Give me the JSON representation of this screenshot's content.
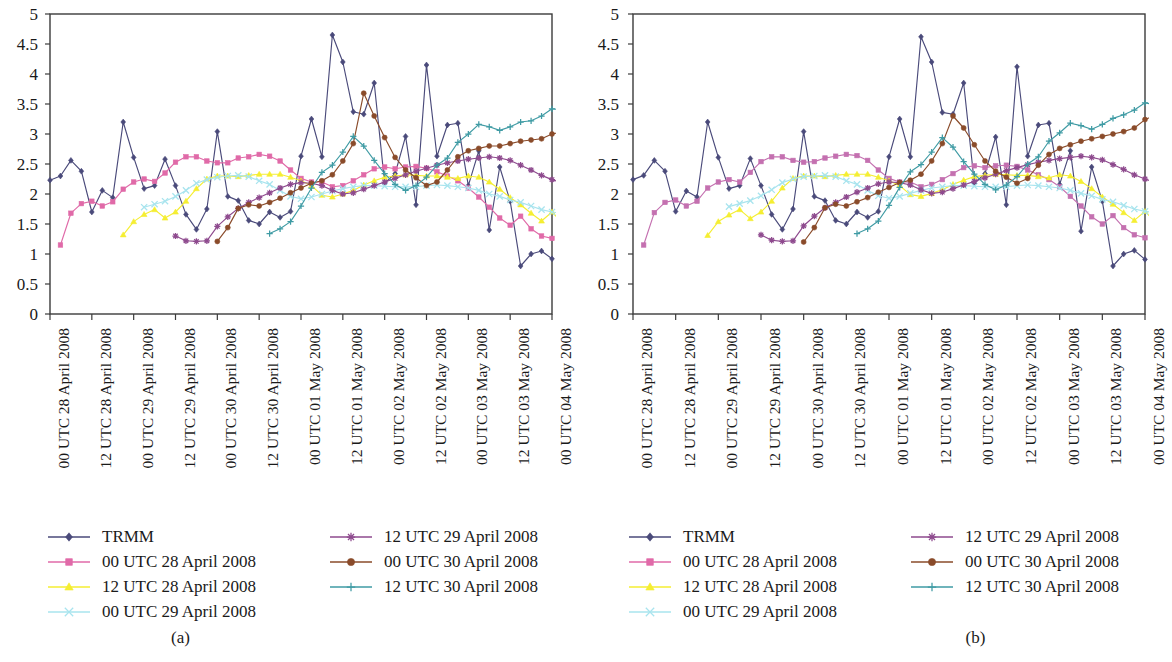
{
  "figure": {
    "panels": [
      {
        "id": "a",
        "caption": "(a)"
      },
      {
        "id": "b",
        "caption": "(b)"
      }
    ]
  },
  "axis": {
    "y_ticks": [
      "0",
      "0.5",
      "1",
      "1.5",
      "2",
      "2.5",
      "3",
      "3.5",
      "4",
      "4.5",
      "5"
    ],
    "x_ticks": [
      "00 UTC 28 April 2008",
      "12 UTC 28 April 2008",
      "00 UTC 29 April 2008",
      "12 UTC 29 April 2008",
      "00 UTC 30 April 2008",
      "12 UTC 30 April 2008",
      "00 UTC 01 May 2008",
      "12 UTC 01 May 2008",
      "00 UTC 02 May 2008",
      "12 UTC 02 May 2008",
      "00 UTC 03 May 2008",
      "12 UTC 03 May 2008",
      "00 UTC 04 May 2008"
    ]
  },
  "legend": {
    "entries": [
      {
        "label": "TRMM",
        "color": "#4a4a7a",
        "marker": "diamond",
        "col": "left"
      },
      {
        "label": "00 UTC 28 April 2008",
        "color": "#e06aa8",
        "marker": "square",
        "col": "left"
      },
      {
        "label": "12 UTC 28 April 2008",
        "color": "#f5ee32",
        "marker": "triangle",
        "col": "left"
      },
      {
        "label": "00 UTC 29 April 2008",
        "color": "#a8e4ee",
        "marker": "xmark",
        "col": "left"
      },
      {
        "label": "12 UTC 29 April 2008",
        "color": "#8e4a8e",
        "marker": "star",
        "col": "right"
      },
      {
        "label": "00 UTC 30 April 2008",
        "color": "#8a4b2a",
        "marker": "circle",
        "col": "right"
      },
      {
        "label": "12 UTC 30 April 2008",
        "color": "#3f9ba4",
        "marker": "plus",
        "col": "right"
      }
    ]
  },
  "chart_data": [
    {
      "panel": "(a)",
      "type": "line",
      "title": "",
      "xlabel": "",
      "ylabel": "",
      "ylim": [
        0,
        5
      ],
      "ytick_step": 0.5,
      "grid": false,
      "legend_position": "bottom",
      "x_tick_labels": [
        "00 UTC 28 April 2008",
        "12 UTC 28 April 2008",
        "00 UTC 29 April 2008",
        "12 UTC 29 April 2008",
        "00 UTC 30 April 2008",
        "12 UTC 30 April 2008",
        "00 UTC 01 May 2008",
        "12 UTC 01 May 2008",
        "00 UTC 02 May 2008",
        "12 UTC 02 May 2008",
        "00 UTC 03 May 2008",
        "12 UTC 03 May 2008",
        "00 UTC 04 May 2008"
      ],
      "x_index_of_tick": [
        0,
        4,
        8,
        12,
        16,
        20,
        24,
        28,
        32,
        36,
        40,
        44,
        48
      ],
      "series": [
        {
          "name": "TRMM",
          "color": "#4a4a7a",
          "marker": "diamond",
          "x_start": 0,
          "values": [
            2.23,
            2.3,
            2.56,
            2.38,
            1.7,
            2.06,
            1.94,
            3.2,
            2.61,
            2.09,
            2.14,
            2.58,
            2.14,
            1.66,
            1.41,
            1.75,
            3.04,
            1.96,
            1.89,
            1.56,
            1.5,
            1.7,
            1.61,
            1.71,
            2.63,
            3.25,
            2.62,
            4.65,
            4.2,
            3.37,
            3.33,
            3.85,
            2.18,
            2.34,
            2.96,
            1.82,
            4.15,
            2.63,
            3.15,
            3.18,
            2.14,
            2.72,
            1.4,
            2.45,
            1.88,
            0.8,
            1.0,
            1.05,
            0.92
          ]
        },
        {
          "name": "00 UTC 28 April 2008",
          "color": "#e06aa8",
          "marker": "square",
          "x_start": 1,
          "values": [
            1.15,
            1.68,
            1.84,
            1.88,
            1.8,
            1.87,
            2.08,
            2.2,
            2.25,
            2.21,
            2.35,
            2.53,
            2.62,
            2.62,
            2.55,
            2.52,
            2.52,
            2.6,
            2.62,
            2.66,
            2.63,
            2.55,
            2.4,
            2.26,
            2.2,
            2.2,
            2.12,
            2.14,
            2.22,
            2.32,
            2.42,
            2.45,
            2.42,
            2.45,
            2.46,
            2.43,
            2.37,
            2.3,
            2.22,
            2.1,
            1.95,
            1.78,
            1.6,
            1.48,
            1.63,
            1.42,
            1.3,
            1.26
          ]
        },
        {
          "name": "12 UTC 28 April 2008",
          "color": "#f5ee32",
          "marker": "triangle",
          "x_start": 7,
          "values": [
            1.32,
            1.54,
            1.66,
            1.74,
            1.6,
            1.7,
            1.88,
            2.09,
            2.25,
            2.3,
            2.3,
            2.29,
            2.31,
            2.33,
            2.33,
            2.33,
            2.28,
            2.22,
            2.14,
            1.98,
            1.95,
            2.0,
            2.06,
            2.15,
            2.22,
            2.28,
            2.3,
            2.32,
            2.31,
            2.3,
            2.3,
            2.28,
            2.26,
            2.3,
            2.28,
            2.2,
            2.08,
            1.94,
            1.82,
            1.68,
            1.55,
            1.7,
            1.52,
            1.4,
            1.35
          ]
        },
        {
          "name": "00 UTC 29 April 2008",
          "color": "#a8e4ee",
          "marker": "xmark",
          "x_start": 9,
          "values": [
            1.78,
            1.83,
            1.88,
            1.96,
            2.06,
            2.18,
            2.24,
            2.28,
            2.3,
            2.31,
            2.29,
            2.22,
            2.16,
            2.06,
            1.96,
            1.92,
            1.95,
            2.0,
            2.05,
            2.09,
            2.12,
            2.14,
            2.14,
            2.13,
            2.12,
            2.12,
            2.12,
            2.14,
            2.15,
            2.14,
            2.12,
            2.1,
            2.06,
            2.0,
            1.96,
            1.9,
            1.86,
            1.8,
            1.74,
            1.7,
            1.68,
            1.7
          ]
        },
        {
          "name": "12 UTC 29 April 2008",
          "color": "#8e4a8e",
          "marker": "star",
          "x_start": 12,
          "values": [
            1.3,
            1.22,
            1.21,
            1.22,
            1.46,
            1.62,
            1.76,
            1.86,
            1.94,
            2.02,
            2.1,
            2.16,
            2.19,
            2.18,
            2.14,
            2.06,
            2.0,
            2.02,
            2.08,
            2.14,
            2.2,
            2.26,
            2.32,
            2.38,
            2.43,
            2.48,
            2.52,
            2.55,
            2.58,
            2.6,
            2.62,
            2.6,
            2.56,
            2.48,
            2.4,
            2.31,
            2.24,
            2.18,
            2.12,
            2.1,
            2.16,
            2.14,
            2.1,
            2.0
          ]
        },
        {
          "name": "00 UTC 30 April 2008",
          "color": "#8a4b2a",
          "marker": "circle",
          "x_start": 16,
          "values": [
            1.21,
            1.44,
            1.76,
            1.82,
            1.8,
            1.86,
            1.93,
            2.02,
            2.1,
            2.18,
            2.22,
            2.32,
            2.55,
            2.84,
            3.68,
            3.3,
            2.94,
            2.61,
            2.4,
            2.27,
            2.14,
            2.2,
            2.4,
            2.62,
            2.72,
            2.76,
            2.8,
            2.8,
            2.84,
            2.88,
            2.9,
            2.92,
            3.0,
            3.04,
            3.02,
            2.86,
            2.7,
            2.6,
            2.52,
            2.48,
            2.5,
            2.6,
            2.66
          ]
        },
        {
          "name": "12 UTC 30 April 2008",
          "color": "#3f9ba4",
          "marker": "plus",
          "x_start": 21,
          "values": [
            1.34,
            1.42,
            1.54,
            1.8,
            2.1,
            2.36,
            2.48,
            2.7,
            2.96,
            2.8,
            2.56,
            2.34,
            2.16,
            2.06,
            2.14,
            2.28,
            2.48,
            2.6,
            2.86,
            3.0,
            3.16,
            3.12,
            3.06,
            3.12,
            3.2,
            3.22,
            3.3,
            3.42,
            3.4,
            3.28,
            3.08,
            2.88,
            2.72,
            2.6,
            2.52,
            2.48,
            2.44,
            2.44
          ]
        }
      ]
    },
    {
      "panel": "(b)",
      "type": "line",
      "title": "",
      "xlabel": "",
      "ylabel": "",
      "ylim": [
        0,
        5
      ],
      "ytick_step": 0.5,
      "grid": false,
      "legend_position": "bottom",
      "x_tick_labels": [
        "00 UTC 28 April 2008",
        "12 UTC 28 April 2008",
        "00 UTC 29 April 2008",
        "12 UTC 29 April 2008",
        "00 UTC 30 April 2008",
        "12 UTC 30 April 2008",
        "00 UTC 01 May 2008",
        "12 UTC 01 May 2008",
        "00 UTC 02 May 2008",
        "12 UTC 02 May 2008",
        "00 UTC 03 May 2008",
        "12 UTC 03 May 2008",
        "00 UTC 04 May 2008"
      ],
      "x_index_of_tick": [
        0,
        4,
        8,
        12,
        16,
        20,
        24,
        28,
        32,
        36,
        40,
        44,
        48
      ],
      "series": [
        {
          "name": "TRMM",
          "color": "#4a4a7a",
          "marker": "diamond",
          "x_start": 0,
          "values": [
            2.24,
            2.31,
            2.56,
            2.38,
            1.71,
            2.05,
            1.95,
            3.2,
            2.61,
            2.09,
            2.14,
            2.59,
            2.14,
            1.66,
            1.41,
            1.75,
            3.04,
            1.96,
            1.89,
            1.56,
            1.5,
            1.7,
            1.61,
            1.71,
            2.62,
            3.25,
            2.62,
            4.62,
            4.2,
            3.36,
            3.33,
            3.85,
            2.18,
            2.34,
            2.95,
            1.82,
            4.12,
            2.63,
            3.15,
            3.18,
            2.16,
            2.72,
            1.38,
            2.45,
            1.88,
            0.8,
            1.0,
            1.06,
            0.91
          ]
        },
        {
          "name": "00 UTC 28 April 2008",
          "color": "#c470b0",
          "marker": "square",
          "x_start": 1,
          "values": [
            1.15,
            1.69,
            1.86,
            1.9,
            1.8,
            1.88,
            2.1,
            2.2,
            2.24,
            2.2,
            2.36,
            2.54,
            2.62,
            2.62,
            2.56,
            2.53,
            2.54,
            2.6,
            2.63,
            2.66,
            2.64,
            2.56,
            2.4,
            2.26,
            2.2,
            2.2,
            2.12,
            2.16,
            2.24,
            2.34,
            2.44,
            2.47,
            2.44,
            2.47,
            2.48,
            2.46,
            2.4,
            2.32,
            2.24,
            2.12,
            1.96,
            1.8,
            1.62,
            1.5,
            1.64,
            1.44,
            1.32,
            1.27
          ]
        },
        {
          "name": "12 UTC 28 April 2008",
          "color": "#f5ee32",
          "marker": "triangle",
          "x_start": 7,
          "values": [
            1.31,
            1.54,
            1.65,
            1.74,
            1.59,
            1.7,
            1.88,
            2.1,
            2.26,
            2.3,
            2.3,
            2.29,
            2.31,
            2.33,
            2.33,
            2.33,
            2.28,
            2.22,
            2.14,
            1.99,
            1.96,
            2.01,
            2.07,
            2.16,
            2.23,
            2.29,
            2.31,
            2.33,
            2.32,
            2.31,
            2.31,
            2.29,
            2.27,
            2.32,
            2.3,
            2.21,
            2.09,
            1.95,
            1.83,
            1.69,
            1.56,
            1.71,
            1.53,
            1.41,
            1.36
          ]
        },
        {
          "name": "00 UTC 29 April 2008",
          "color": "#a8e4ee",
          "marker": "xmark",
          "x_start": 9,
          "values": [
            1.79,
            1.84,
            1.89,
            1.97,
            2.07,
            2.19,
            2.25,
            2.29,
            2.3,
            2.31,
            2.29,
            2.22,
            2.16,
            2.06,
            1.97,
            1.93,
            1.96,
            2.01,
            2.06,
            2.1,
            2.12,
            2.14,
            2.14,
            2.13,
            2.12,
            2.12,
            2.12,
            2.14,
            2.15,
            2.14,
            2.12,
            2.1,
            2.06,
            2.01,
            1.97,
            1.91,
            1.87,
            1.81,
            1.75,
            1.71,
            1.69,
            1.71
          ]
        },
        {
          "name": "12 UTC 29 April 2008",
          "color": "#8e4a8e",
          "marker": "star",
          "x_start": 12,
          "values": [
            1.32,
            1.23,
            1.21,
            1.22,
            1.47,
            1.63,
            1.77,
            1.86,
            1.95,
            2.03,
            2.1,
            2.17,
            2.2,
            2.19,
            2.15,
            2.07,
            2.01,
            2.03,
            2.09,
            2.15,
            2.21,
            2.27,
            2.33,
            2.39,
            2.44,
            2.49,
            2.53,
            2.56,
            2.59,
            2.61,
            2.63,
            2.61,
            2.57,
            2.49,
            2.41,
            2.32,
            2.25,
            2.19,
            2.13,
            2.11,
            2.17,
            2.15,
            2.11,
            2.0
          ]
        },
        {
          "name": "00 UTC 30 April 2008",
          "color": "#8a4b2a",
          "marker": "circle",
          "x_start": 16,
          "values": [
            1.2,
            1.44,
            1.77,
            1.83,
            1.8,
            1.87,
            1.94,
            2.03,
            2.11,
            2.19,
            2.23,
            2.33,
            2.55,
            2.84,
            3.3,
            3.1,
            2.82,
            2.55,
            2.38,
            2.28,
            2.18,
            2.26,
            2.48,
            2.66,
            2.76,
            2.82,
            2.88,
            2.92,
            2.96,
            3.0,
            3.04,
            3.1,
            3.24,
            3.32,
            3.26,
            3.04,
            2.84,
            2.68,
            2.56,
            2.5,
            2.52,
            2.62,
            2.66
          ]
        },
        {
          "name": "12 UTC 30 April 2008",
          "color": "#3f9ba4",
          "marker": "plus",
          "x_start": 21,
          "values": [
            1.34,
            1.42,
            1.55,
            1.81,
            2.11,
            2.37,
            2.49,
            2.7,
            2.94,
            2.78,
            2.54,
            2.33,
            2.16,
            2.07,
            2.15,
            2.29,
            2.5,
            2.62,
            2.88,
            3.02,
            3.18,
            3.14,
            3.08,
            3.16,
            3.26,
            3.32,
            3.4,
            3.52,
            3.48,
            3.34,
            3.14,
            2.92,
            2.76,
            2.62,
            2.54,
            2.5,
            2.46,
            2.46
          ]
        }
      ]
    }
  ]
}
